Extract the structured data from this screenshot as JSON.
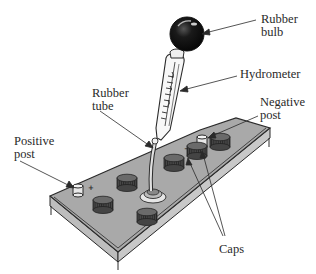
{
  "diagram": {
    "labels": {
      "rubber_bulb": [
        "Rubber",
        "bulb"
      ],
      "hydrometer": "Hydrometer",
      "rubber_tube": [
        "Rubber",
        "tube"
      ],
      "negative_post": [
        "Negative",
        "post"
      ],
      "positive_post": [
        "Positive",
        "post"
      ],
      "caps": "Caps"
    },
    "terminal_marks": {
      "positive": "+",
      "negative": "−"
    },
    "colors": {
      "line": "#2a2a2a",
      "battery_top": "#a9a9a9",
      "battery_side": "#bdbdbd",
      "cap": "#555555",
      "cap_top": "#6a6a6a",
      "bulb": "#1a1a1a",
      "post": "#e8e8e8"
    }
  }
}
